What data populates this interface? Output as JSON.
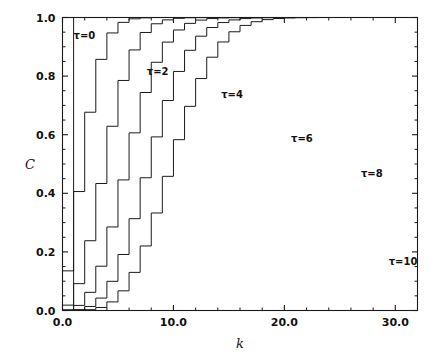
{
  "chart_data": {
    "type": "line",
    "subtype": "step",
    "title": "",
    "xlabel": "k",
    "ylabel": "C",
    "xlim": [
      0,
      32
    ],
    "ylim": [
      0.0,
      1.0
    ],
    "grid": false,
    "legend_position": "inline-annotations",
    "x_ticks": [
      0,
      10,
      20,
      30
    ],
    "x_tick_labels": [
      "0.0",
      "10.0",
      "20.0",
      "30.0"
    ],
    "x_minor_tick_step": 2,
    "y_ticks": [
      0.0,
      0.2,
      0.4,
      0.6,
      0.8,
      1.0
    ],
    "y_tick_labels": [
      "0.0",
      "0.2",
      "0.4",
      "0.6",
      "0.8",
      "1.0"
    ],
    "y_minor_tick_step": 0.05,
    "x": [
      0,
      1,
      2,
      3,
      4,
      5,
      6,
      7,
      8,
      9,
      10,
      11,
      12,
      13,
      14,
      15,
      16,
      17,
      18,
      19,
      20,
      21,
      22,
      23,
      24,
      25,
      26,
      27,
      28,
      29,
      30,
      31,
      32
    ],
    "series": [
      {
        "name": "t=0",
        "label": "τ=0",
        "tau": 0,
        "label_x": 1.0,
        "label_y": 0.925,
        "values": [
          1,
          1,
          1,
          1,
          1,
          1,
          1,
          1,
          1,
          1,
          1,
          1,
          1,
          1,
          1,
          1,
          1,
          1,
          1,
          1,
          1,
          1,
          1,
          1,
          1,
          1,
          1,
          1,
          1,
          1,
          1,
          1,
          1
        ]
      },
      {
        "name": "t=2",
        "label": "τ=2",
        "tau": 2,
        "label_x": 7.6,
        "label_y": 0.805,
        "values": [
          0.1353,
          0.406,
          0.6767,
          0.8571,
          0.9473,
          0.9834,
          0.9955,
          0.9989,
          0.9998,
          1,
          1,
          1,
          1,
          1,
          1,
          1,
          1,
          1,
          1,
          1,
          1,
          1,
          1,
          1,
          1,
          1,
          1,
          1,
          1,
          1,
          1,
          1,
          1
        ]
      },
      {
        "name": "t=4",
        "label": "τ=4",
        "tau": 4,
        "label_x": 14.3,
        "label_y": 0.725,
        "values": [
          0.0183,
          0.0916,
          0.2381,
          0.4335,
          0.6288,
          0.7851,
          0.8893,
          0.9489,
          0.9786,
          0.9919,
          0.9972,
          0.9991,
          0.9997,
          0.9999,
          1,
          1,
          1,
          1,
          1,
          1,
          1,
          1,
          1,
          1,
          1,
          1,
          1,
          1,
          1,
          1,
          1,
          1,
          1
        ]
      },
      {
        "name": "t=6",
        "label": "τ=6",
        "tau": 6,
        "label_x": 20.6,
        "label_y": 0.575,
        "values": [
          0.0025,
          0.0174,
          0.062,
          0.1512,
          0.2851,
          0.4457,
          0.6063,
          0.744,
          0.8472,
          0.9161,
          0.9574,
          0.9799,
          0.9912,
          0.9964,
          0.9986,
          0.9995,
          0.9998,
          0.9999,
          1,
          1,
          1,
          1,
          1,
          1,
          1,
          1,
          1,
          1,
          1,
          1,
          1,
          1,
          1
        ]
      },
      {
        "name": "t=8",
        "label": "τ=8",
        "tau": 8,
        "label_x": 26.9,
        "label_y": 0.455,
        "values": [
          0.0003,
          0.003,
          0.0138,
          0.0424,
          0.0996,
          0.1912,
          0.3134,
          0.453,
          0.5925,
          0.7166,
          0.8159,
          0.8881,
          0.9362,
          0.9658,
          0.9827,
          0.9918,
          0.9963,
          0.9984,
          0.9993,
          0.9997,
          0.9999,
          1,
          1,
          1,
          1,
          1,
          1,
          1,
          1,
          1,
          1,
          1,
          1
        ]
      },
      {
        "name": "t=10",
        "label": "τ=10",
        "tau": 10,
        "label_x": 29.4,
        "label_y": 0.155,
        "values": [
          5e-05,
          0.0005,
          0.0028,
          0.0103,
          0.0293,
          0.0671,
          0.1301,
          0.2202,
          0.3328,
          0.4579,
          0.583,
          0.6968,
          0.7916,
          0.8645,
          0.9165,
          0.9513,
          0.973,
          0.9857,
          0.9928,
          0.9965,
          0.9984,
          0.9993,
          0.9997,
          0.9999,
          1,
          1,
          1,
          1,
          1,
          1,
          1,
          1,
          1
        ]
      }
    ],
    "note_truncated_top": "curves are clipped at C=1.0 (axis top)"
  }
}
